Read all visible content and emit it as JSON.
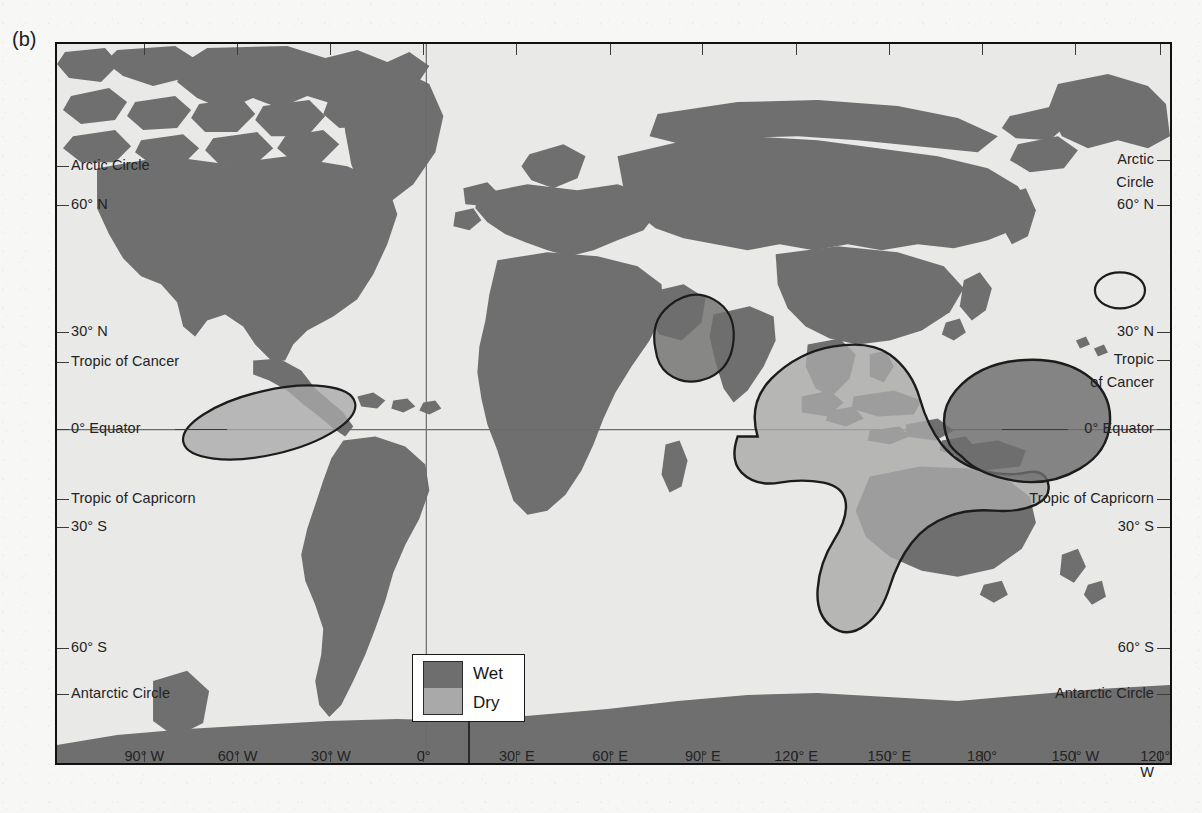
{
  "figure": {
    "panel_label": "(b)"
  },
  "legend": {
    "title": "",
    "items": [
      {
        "label": "Wet",
        "color": "#6e6e6e",
        "swatch_name": "wet-swatch"
      },
      {
        "label": "Dry",
        "color": "#a8a8a8",
        "swatch_name": "dry-swatch"
      }
    ]
  },
  "colors": {
    "ocean": "#e9e9e7",
    "land": "#6f6f6f",
    "wet": "#6e6e6e",
    "dry": "#a9a9a9",
    "outline": "#1c1c1c",
    "graticule": "#6b6b6b",
    "frame": "#111111",
    "text": "#232323"
  },
  "axes": {
    "longitude_top": [
      {
        "label": "90° W",
        "x_pct": 8.0
      },
      {
        "label": "60° W",
        "x_pct": 16.35
      },
      {
        "label": "30° W",
        "x_pct": 24.7
      },
      {
        "label": "0°",
        "x_pct": 33.0
      },
      {
        "label": "30° E",
        "x_pct": 41.35
      },
      {
        "label": "60° E",
        "x_pct": 49.7
      },
      {
        "label": "90° E",
        "x_pct": 58.0
      },
      {
        "label": "120° E",
        "x_pct": 66.35
      },
      {
        "label": "150° E",
        "x_pct": 74.7
      },
      {
        "label": "180°",
        "x_pct": 83.0
      },
      {
        "label": "150° W",
        "x_pct": 91.35
      },
      {
        "label": "120° W",
        "x_pct": 99.0
      }
    ],
    "longitude_bottom": [
      {
        "label": "90° W",
        "x_pct": 8.0
      },
      {
        "label": "60° W",
        "x_pct": 16.35
      },
      {
        "label": "30° W",
        "x_pct": 24.7
      },
      {
        "label": "0°",
        "x_pct": 33.0
      },
      {
        "label": "30° E",
        "x_pct": 41.35
      },
      {
        "label": "60° E",
        "x_pct": 49.7
      },
      {
        "label": "90° E",
        "x_pct": 58.0
      },
      {
        "label": "120° E",
        "x_pct": 66.35
      },
      {
        "label": "150° E",
        "x_pct": 74.7
      },
      {
        "label": "180°",
        "x_pct": 83.0
      },
      {
        "label": "150° W",
        "x_pct": 91.35
      },
      {
        "label": "120° W",
        "x_pct": 99.0
      }
    ],
    "latitude_left": [
      {
        "label": "Arctic Circle",
        "y": 122
      },
      {
        "label": "60° N",
        "y": 161
      },
      {
        "label": "30° N",
        "y": 288
      },
      {
        "label": "Tropic of Cancer",
        "y": 318
      },
      {
        "label": "0° Equator",
        "y": 385
      },
      {
        "label": "Tropic of Capricorn",
        "y": 455
      },
      {
        "label": "30° S",
        "y": 483
      },
      {
        "label": "60° S",
        "y": 604
      },
      {
        "label": "Antarctic Circle",
        "y": 650
      }
    ],
    "latitude_right": [
      {
        "label": "Arctic",
        "y": 116
      },
      {
        "label": "Circle",
        "y": 139
      },
      {
        "label": "60° N",
        "y": 161
      },
      {
        "label": "30° N",
        "y": 288
      },
      {
        "label": "Tropic",
        "y": 316
      },
      {
        "label": "of Cancer",
        "y": 339
      },
      {
        "label": "0° Equator",
        "y": 385
      },
      {
        "label": "Tropic of Capricorn",
        "y": 455
      },
      {
        "label": "30° S",
        "y": 483
      },
      {
        "label": "60° S",
        "y": 604
      },
      {
        "label": "Antarctic Circle",
        "y": 650
      }
    ]
  },
  "chart_data": {
    "type": "map",
    "title": "",
    "projection": "equirectangular",
    "lon_range": [
      -110,
      -115
    ],
    "lat_range": [
      80,
      -78
    ],
    "center_lon": 20,
    "legend_entries": [
      "Wet",
      "Dry"
    ],
    "anomaly_regions": [
      {
        "name": "caribbean-dry",
        "class": "Dry",
        "approx_center_lon": -72,
        "approx_center_lat": 8
      },
      {
        "name": "india-wet",
        "class": "Wet",
        "approx_center_lon": 78,
        "approx_center_lat": 20
      },
      {
        "name": "maritime-continent-australia-dry",
        "class": "Dry",
        "approx_center_lon": 130,
        "approx_center_lat": -8
      },
      {
        "name": "central-pacific-wet",
        "class": "Wet",
        "approx_center_lon": 177,
        "approx_center_lat": -2
      },
      {
        "name": "baja-outline",
        "class": "outline-only",
        "approx_center_lon": -118,
        "approx_center_lat": 32
      }
    ]
  },
  "ghost_text": [
    {
      "text": "the contrast of atmospheric circulation in",
      "x": 640,
      "y": 572
    },
    {
      "text": "and associated rainfall patterns across",
      "x": 660,
      "y": 600
    },
    {
      "text": "the tropical belt regions",
      "x": 700,
      "y": 628
    },
    {
      "text": "observed during warm phases",
      "x": 600,
      "y": 656
    },
    {
      "text": "of the oscillation",
      "x": 700,
      "y": 684
    }
  ]
}
